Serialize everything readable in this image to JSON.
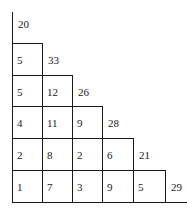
{
  "diagram": {
    "type": "staircase-table",
    "rows": [
      {
        "cells": [],
        "total": "20"
      },
      {
        "cells": [
          "5"
        ],
        "total": "33"
      },
      {
        "cells": [
          "5",
          "12"
        ],
        "total": "26"
      },
      {
        "cells": [
          "4",
          "11",
          "9"
        ],
        "total": "28"
      },
      {
        "cells": [
          "2",
          "8",
          "2",
          "6"
        ],
        "total": "21"
      },
      {
        "cells": [
          "1",
          "7",
          "3",
          "9",
          "5"
        ],
        "total": "29"
      }
    ]
  }
}
